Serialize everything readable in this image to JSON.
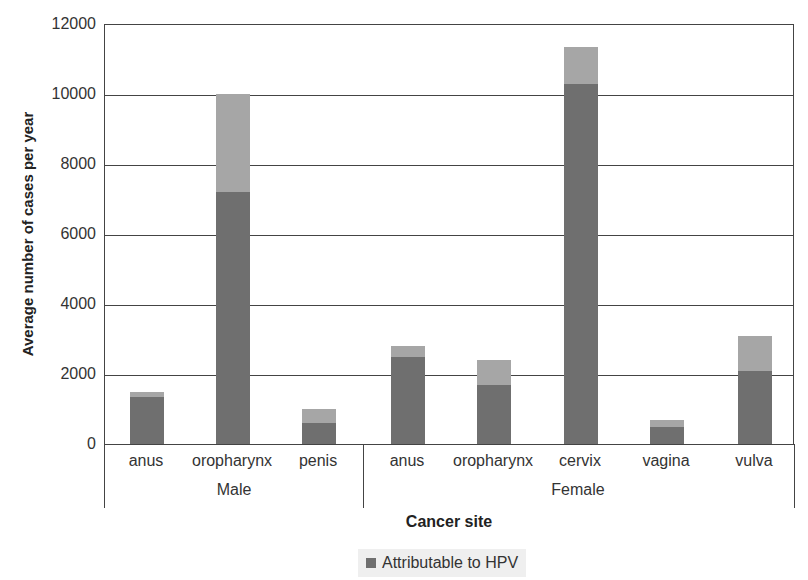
{
  "chart_data": {
    "type": "bar",
    "stacked": true,
    "title": "",
    "xlabel": "Cancer site",
    "ylabel": "Average number of cases per year",
    "ylim": [
      0,
      12000
    ],
    "yticks": [
      0,
      2000,
      4000,
      6000,
      8000,
      10000,
      12000
    ],
    "grid": true,
    "groups": [
      {
        "name": "Male",
        "categories": [
          "anus",
          "oropharynx",
          "penis"
        ]
      },
      {
        "name": "Female",
        "categories": [
          "anus",
          "oropharynx",
          "cervix",
          "vagina",
          "vulva"
        ]
      }
    ],
    "categories": [
      "anus (Male)",
      "oropharynx (Male)",
      "penis (Male)",
      "anus (Female)",
      "oropharynx (Female)",
      "cervix (Female)",
      "vagina (Female)",
      "vulva (Female)"
    ],
    "series": [
      {
        "name": "Attributable to HPV",
        "color": "#6f6f6f",
        "values": [
          1350,
          7200,
          600,
          2500,
          1700,
          10300,
          500,
          2100
        ]
      },
      {
        "name": "Total cases",
        "color": "#a6a6a6",
        "values": [
          1500,
          10000,
          1000,
          2800,
          2400,
          11350,
          700,
          3100
        ]
      }
    ],
    "legend": {
      "position": "bottom",
      "entries": [
        "Attributable to HPV"
      ]
    }
  },
  "axis": {
    "ylabel": "Average number of cases per year",
    "xlabel": "Cancer site",
    "yticks": [
      "0",
      "2000",
      "4000",
      "6000",
      "8000",
      "10000",
      "12000"
    ]
  },
  "x_categories": [
    "anus",
    "oropharynx",
    "penis",
    "anus",
    "oropharynx",
    "cervix",
    "vagina",
    "vulva"
  ],
  "x_groups": [
    "Male",
    "Female"
  ],
  "legend": {
    "label": "Attributable to HPV",
    "color": "#6f6f6f"
  },
  "colors": {
    "hpv": "#6f6f6f",
    "total": "#a6a6a6"
  }
}
